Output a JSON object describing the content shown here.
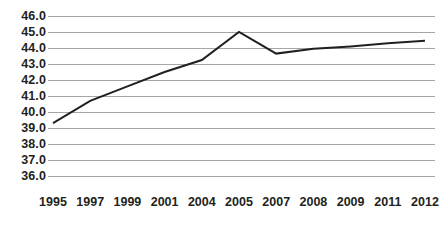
{
  "chart_data": {
    "type": "line",
    "title": "",
    "subtitle": "",
    "xlabel": "",
    "ylabel": "",
    "categories": [
      "1995",
      "1997",
      "1999",
      "2001",
      "2004",
      "2005",
      "2007",
      "2008",
      "2009",
      "2011",
      "2012"
    ],
    "series": [
      {
        "name": "series-1",
        "values": [
          39.3,
          40.7,
          41.6,
          42.5,
          43.25,
          45.0,
          43.65,
          43.95,
          44.1,
          44.3,
          44.45
        ],
        "color": "#231f20",
        "line_width": 2,
        "markers": false
      }
    ],
    "ylim": [
      36.0,
      46.0
    ],
    "y_ticks": [
      46.0,
      45.0,
      44.0,
      43.0,
      42.0,
      41.0,
      40.0,
      39.0,
      38.0,
      37.0,
      36.0
    ],
    "y_tick_labels": [
      "46.0",
      "45.0",
      "44.0",
      "43.0",
      "42.0",
      "41.0",
      "40.0",
      "39.0",
      "38.0",
      "37.0",
      "36.0"
    ],
    "x_tick_labels": [
      "1995",
      "1997",
      "1999",
      "2001",
      "2004",
      "2005",
      "2007",
      "2008",
      "2009",
      "2011",
      "2012"
    ],
    "grid": {
      "horizontal": true,
      "vertical": false,
      "color": "#a6a6a6"
    },
    "legend": {
      "visible": false,
      "position": "none",
      "entries": []
    },
    "axes": {
      "left_spine": false,
      "bottom_spine": false,
      "top_spine": false,
      "right_spine": false
    },
    "annotations": [],
    "background_color": "#ffffff",
    "text_color": "#231f20"
  }
}
